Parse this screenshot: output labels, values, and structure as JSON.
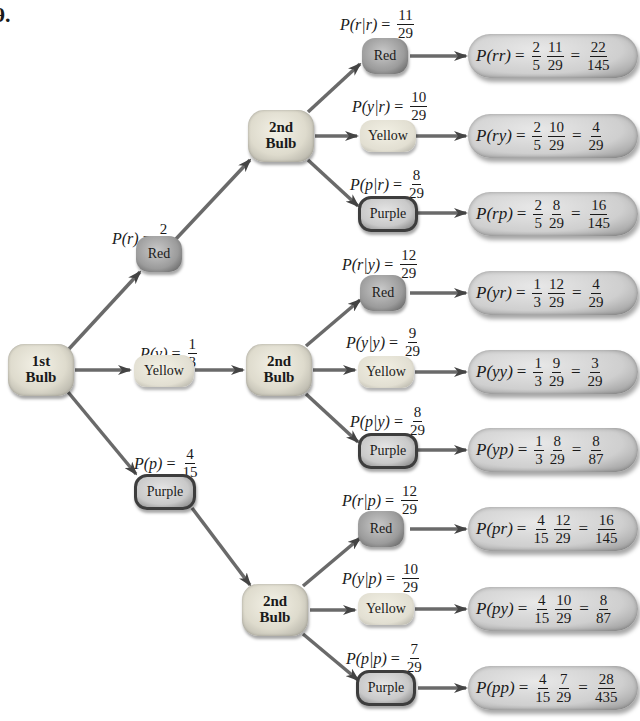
{
  "problem_number": "9.",
  "first_stage": {
    "root_label": "1st Bulb",
    "root_line1": "1st",
    "root_line2": "Bulb",
    "branches": [
      {
        "color": "Red",
        "prob_label": "P(r)",
        "num": "2",
        "den": "5"
      },
      {
        "color": "Yellow",
        "prob_label": "P(y)",
        "num": "1",
        "den": "3"
      },
      {
        "color": "Purple",
        "prob_label": "P(p)",
        "num": "4",
        "den": "15"
      }
    ]
  },
  "second_stage_label": {
    "line1": "2nd",
    "line2": "Bulb"
  },
  "second_stage": [
    {
      "color": "Red",
      "cond_label": "P(r|r)",
      "num": "11",
      "den": "29",
      "result": {
        "label": "P(rr)",
        "a_num": "2",
        "a_den": "5",
        "b_num": "11",
        "b_den": "29",
        "r_num": "22",
        "r_den": "145"
      }
    },
    {
      "color": "Yellow",
      "cond_label": "P(y|r)",
      "num": "10",
      "den": "29",
      "result": {
        "label": "P(ry)",
        "a_num": "2",
        "a_den": "5",
        "b_num": "10",
        "b_den": "29",
        "r_num": "4",
        "r_den": "29"
      }
    },
    {
      "color": "Purple",
      "cond_label": "P(p|r)",
      "num": "8",
      "den": "29",
      "result": {
        "label": "P(rp)",
        "a_num": "2",
        "a_den": "5",
        "b_num": "8",
        "b_den": "29",
        "r_num": "16",
        "r_den": "145"
      }
    },
    {
      "color": "Red",
      "cond_label": "P(r|y)",
      "num": "12",
      "den": "29",
      "result": {
        "label": "P(yr)",
        "a_num": "1",
        "a_den": "3",
        "b_num": "12",
        "b_den": "29",
        "r_num": "4",
        "r_den": "29"
      }
    },
    {
      "color": "Yellow",
      "cond_label": "P(y|y)",
      "num": "9",
      "den": "29",
      "result": {
        "label": "P(yy)",
        "a_num": "1",
        "a_den": "3",
        "b_num": "9",
        "b_den": "29",
        "r_num": "3",
        "r_den": "29"
      }
    },
    {
      "color": "Purple",
      "cond_label": "P(p|y)",
      "num": "8",
      "den": "29",
      "result": {
        "label": "P(yp)",
        "a_num": "1",
        "a_den": "3",
        "b_num": "8",
        "b_den": "29",
        "r_num": "8",
        "r_den": "87"
      }
    },
    {
      "color": "Red",
      "cond_label": "P(r|p)",
      "num": "12",
      "den": "29",
      "result": {
        "label": "P(pr)",
        "a_num": "4",
        "a_den": "15",
        "b_num": "12",
        "b_den": "29",
        "r_num": "16",
        "r_den": "145"
      }
    },
    {
      "color": "Yellow",
      "cond_label": "P(y|p)",
      "num": "10",
      "den": "29",
      "result": {
        "label": "P(py)",
        "a_num": "4",
        "a_den": "15",
        "b_num": "10",
        "b_den": "29",
        "r_num": "8",
        "r_den": "87"
      }
    },
    {
      "color": "Purple",
      "cond_label": "P(p|p)",
      "num": "7",
      "den": "29",
      "result": {
        "label": "P(pp)",
        "a_num": "4",
        "a_den": "15",
        "b_num": "7",
        "b_den": "29",
        "r_num": "28",
        "r_den": "435"
      }
    }
  ],
  "symbols": {
    "equals": "="
  },
  "colors": {
    "arrow": "#555555",
    "node_border": "#3d3d3d",
    "background": "#ffffff"
  }
}
